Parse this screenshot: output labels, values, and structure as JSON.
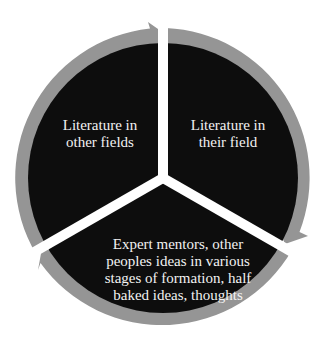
{
  "diagram": {
    "type": "cycle",
    "colors": {
      "segment_fill": "#0d0d0d",
      "ring": "#959595",
      "gap": "#ffffff",
      "text": "#f2f2f2"
    },
    "segments": [
      {
        "id": "left",
        "lines": [
          "Literature in",
          "other fields"
        ]
      },
      {
        "id": "right",
        "lines": [
          "Literature in",
          "their field"
        ]
      },
      {
        "id": "bottom",
        "lines": [
          "Expert mentors, other",
          "peoples ideas in various",
          "stages of formation, half",
          "baked ideas, thoughts"
        ]
      }
    ],
    "arrows": [
      {
        "from": "left",
        "to": "right",
        "direction": "clockwise"
      },
      {
        "from": "right",
        "to": "bottom",
        "direction": "clockwise"
      },
      {
        "from": "bottom",
        "to": "left",
        "direction": "clockwise"
      }
    ]
  }
}
